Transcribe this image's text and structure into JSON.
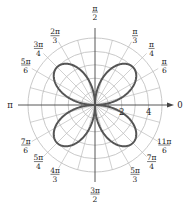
{
  "chart_data": {
    "type": "polar-line",
    "title": "",
    "equation_hint": "four-leaved rose",
    "curve": {
      "form": "r = a sin(2θ)",
      "a": 4,
      "color": "#555555",
      "line_width": 2
    },
    "radial_axis": {
      "circles": [
        1,
        2,
        3,
        4,
        5
      ],
      "tick_labels": [
        "2",
        "4"
      ],
      "tick_values": [
        2,
        4
      ],
      "rmax": 5
    },
    "angular_axis": {
      "spoke_step_deg": 15,
      "labels": [
        {
          "angle_deg": 0,
          "num": "0",
          "den": ""
        },
        {
          "angle_deg": 30,
          "num": "π",
          "den": "6"
        },
        {
          "angle_deg": 45,
          "num": "π",
          "den": "4"
        },
        {
          "angle_deg": 60,
          "num": "π",
          "den": "3"
        },
        {
          "angle_deg": 90,
          "num": "π",
          "den": "2"
        },
        {
          "angle_deg": 120,
          "num": "2π",
          "den": "3"
        },
        {
          "angle_deg": 135,
          "num": "3π",
          "den": "4"
        },
        {
          "angle_deg": 150,
          "num": "5π",
          "den": "6"
        },
        {
          "angle_deg": 180,
          "num": "π",
          "den": ""
        },
        {
          "angle_deg": 210,
          "num": "7π",
          "den": "6"
        },
        {
          "angle_deg": 225,
          "num": "5π",
          "den": "4"
        },
        {
          "angle_deg": 240,
          "num": "4π",
          "den": "3"
        },
        {
          "angle_deg": 270,
          "num": "3π",
          "den": "2"
        },
        {
          "angle_deg": 300,
          "num": "5π",
          "den": "3"
        },
        {
          "angle_deg": 315,
          "num": "7π",
          "den": "4"
        },
        {
          "angle_deg": 330,
          "num": "11π",
          "den": "6"
        }
      ]
    },
    "grid": true,
    "legend": null,
    "colors": {
      "grid": "#bbbbbb",
      "axis": "#444444",
      "curve": "#555555",
      "text": "#222222"
    }
  }
}
